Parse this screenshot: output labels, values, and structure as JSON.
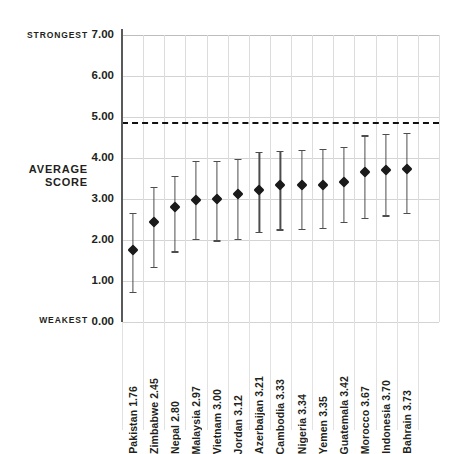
{
  "axis": {
    "title_line1": "AVERAGE",
    "title_line2": "SCORE",
    "strongest_label": "STRONGEST",
    "weakest_label": "WEAKEST",
    "yticks": [
      "7.00",
      "6.00",
      "5.00",
      "4.00",
      "3.00",
      "2.00",
      "1.00",
      "0.00"
    ]
  },
  "colors": {
    "marker": "#1a1a1a",
    "whisker": "#4d4d4d",
    "grid": "#d4d4d4",
    "axis": "#58595b",
    "threshold": "#111111",
    "background": "#ffffff"
  },
  "chart_data": {
    "type": "scatter",
    "title": "",
    "subtitle": "",
    "xlabel": "",
    "ylabel": "AVERAGE SCORE",
    "ylim": [
      0,
      7
    ],
    "yticks": [
      0,
      1,
      2,
      3,
      4,
      5,
      6,
      7
    ],
    "grid": true,
    "legend": "none",
    "annotations": [
      {
        "name": "strongest",
        "text": "STRONGEST",
        "y": 7.0
      },
      {
        "name": "weakest",
        "text": "WEAKEST",
        "y": 0.0
      },
      {
        "name": "threshold-line",
        "text": "",
        "y": 4.88,
        "style": "dashed"
      }
    ],
    "categories": [
      "Pakistan",
      "Zimbabwe",
      "Nepal",
      "Malaysia",
      "Vietnam",
      "Jordan",
      "Azerbaijan",
      "Cambodia",
      "Nigeria",
      "Yemen",
      "Guatemala",
      "Morocco",
      "Indonesia",
      "Bahrain"
    ],
    "values": [
      1.76,
      2.45,
      2.8,
      2.97,
      3.0,
      3.12,
      3.21,
      3.33,
      3.34,
      3.35,
      3.42,
      3.67,
      3.7,
      3.73
    ],
    "error_low": [
      0.74,
      1.34,
      1.72,
      2.02,
      1.99,
      2.02,
      2.2,
      2.26,
      2.28,
      2.3,
      2.44,
      2.54,
      2.6,
      2.66
    ],
    "error_high": [
      2.66,
      3.3,
      3.56,
      3.93,
      3.92,
      3.97,
      4.14,
      4.18,
      4.2,
      4.22,
      4.28,
      4.55,
      4.58,
      4.62
    ],
    "point_labels": [
      "Pakistan  1.76",
      "Zimbabwe  2.45",
      "Nepal  2.80",
      "Malaysia  2.97",
      "Vietnam  3.00",
      "Jordan  3.12",
      "Azerbaijan  3.21",
      "Cambodia  3.33",
      "Nigeria  3.34",
      "Yemen  3.35",
      "Guatemala  3.42",
      "Morocco  3.67",
      "Indonesia  3.70",
      "Bahrain  3.73"
    ]
  }
}
